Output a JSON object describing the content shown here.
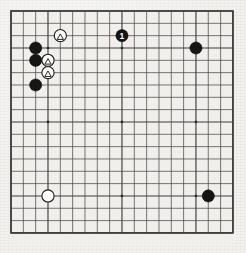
{
  "diagram": {
    "type": "go-board",
    "board_size": 19,
    "colors": {
      "board_background": "#f0efec",
      "page_background": "#f3f2ef",
      "grid_line": "#4a4a4a",
      "border": "#3a3a3a",
      "black_stone": "#151515",
      "white_stone": "#fbfbfa",
      "star_point": "#2b2b2b"
    },
    "geometry": {
      "origin_x": 11,
      "origin_y": 11,
      "cell": 12.33,
      "stone_radius": 6.1,
      "star_radius": 1.35
    },
    "star_points": [
      {
        "col": 4,
        "row": 4
      },
      {
        "col": 10,
        "row": 4
      },
      {
        "col": 16,
        "row": 4
      },
      {
        "col": 4,
        "row": 10
      },
      {
        "col": 10,
        "row": 10
      },
      {
        "col": 16,
        "row": 10
      },
      {
        "col": 4,
        "row": 16
      },
      {
        "col": 10,
        "row": 16
      },
      {
        "col": 16,
        "row": 16
      }
    ],
    "stones": [
      {
        "id": "b-c3r4",
        "color": "black",
        "col": 3,
        "row": 4,
        "label": "",
        "marker": ""
      },
      {
        "id": "b-c3r5",
        "color": "black",
        "col": 3,
        "row": 5,
        "label": "",
        "marker": ""
      },
      {
        "id": "b-c3r7",
        "color": "black",
        "col": 3,
        "row": 7,
        "label": "",
        "marker": ""
      },
      {
        "id": "b-c16r4",
        "color": "black",
        "col": 16,
        "row": 4,
        "label": "",
        "marker": ""
      },
      {
        "id": "b-c17r16",
        "color": "black",
        "col": 17,
        "row": 16,
        "label": "",
        "marker": ""
      },
      {
        "id": "w-c4r16",
        "color": "white",
        "col": 4,
        "row": 16,
        "label": "",
        "marker": ""
      },
      {
        "id": "w-c5r3",
        "color": "white",
        "col": 5,
        "row": 3,
        "label": "",
        "marker": "triangle"
      },
      {
        "id": "w-c4r5",
        "color": "white",
        "col": 4,
        "row": 5,
        "label": "",
        "marker": "triangle"
      },
      {
        "id": "w-c4r6",
        "color": "white",
        "col": 4,
        "row": 6,
        "label": "",
        "marker": "triangle"
      },
      {
        "id": "b-c10r3",
        "color": "black",
        "col": 10,
        "row": 3,
        "label": "1",
        "marker": ""
      }
    ],
    "move_labels": [
      "1"
    ],
    "marker_glyphs": {
      "triangle": "△"
    }
  }
}
